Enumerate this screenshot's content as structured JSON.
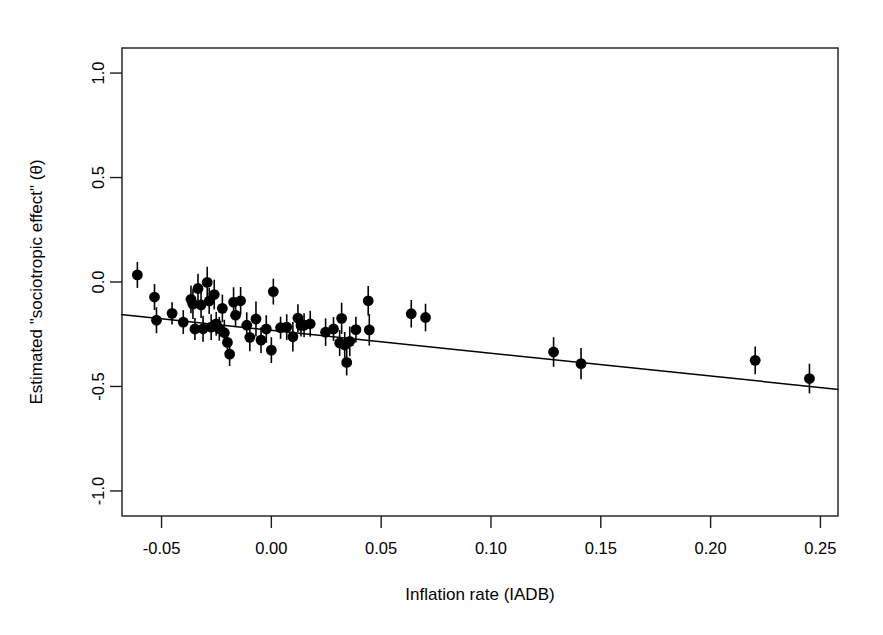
{
  "chart_data": {
    "type": "scatter",
    "title": "",
    "xlabel": "Inflation rate (IADB)",
    "ylabel": "Estimated \"sociotropic effect\" (θ)",
    "xlim": [
      -0.068,
      0.258
    ],
    "ylim": [
      -1.12,
      1.12
    ],
    "xticks": [
      -0.05,
      0.0,
      0.05,
      0.1,
      0.15,
      0.2,
      0.25
    ],
    "xticklabels": [
      "-0.05",
      "0.00",
      "0.05",
      "0.10",
      "0.15",
      "0.20",
      "0.25"
    ],
    "yticks": [
      1.0,
      0.5,
      0.0,
      -0.5,
      -1.0
    ],
    "yticklabels": [
      "1.0",
      "0.5",
      "0.0",
      "-0.5",
      "-1.0"
    ],
    "grid": false,
    "legend": null,
    "marker": "filled-circle",
    "marker_color": "#000000",
    "errorbar_direction": "vertical",
    "errorbar_caps": false,
    "points": [
      {
        "x": -0.061,
        "y": 0.034,
        "yerr": 0.062
      },
      {
        "x": -0.0532,
        "y": -0.072,
        "yerr": 0.062
      },
      {
        "x": -0.0523,
        "y": -0.183,
        "yerr": 0.062
      },
      {
        "x": -0.0452,
        "y": -0.15,
        "yerr": 0.053
      },
      {
        "x": -0.0401,
        "y": -0.192,
        "yerr": 0.057
      },
      {
        "x": -0.0366,
        "y": -0.083,
        "yerr": 0.066
      },
      {
        "x": -0.0357,
        "y": -0.106,
        "yerr": 0.071
      },
      {
        "x": -0.0348,
        "y": -0.225,
        "yerr": 0.053
      },
      {
        "x": -0.0334,
        "y": -0.031,
        "yerr": 0.071
      },
      {
        "x": -0.032,
        "y": -0.11,
        "yerr": 0.062
      },
      {
        "x": -0.0311,
        "y": -0.224,
        "yerr": 0.062
      },
      {
        "x": -0.0292,
        "y": -0.002,
        "yerr": 0.075
      },
      {
        "x": -0.0283,
        "y": -0.091,
        "yerr": 0.062
      },
      {
        "x": -0.0274,
        "y": -0.216,
        "yerr": 0.062
      },
      {
        "x": -0.026,
        "y": -0.06,
        "yerr": 0.071
      },
      {
        "x": -0.0251,
        "y": -0.2,
        "yerr": 0.057
      },
      {
        "x": -0.0237,
        "y": -0.224,
        "yerr": 0.057
      },
      {
        "x": -0.0223,
        "y": -0.126,
        "yerr": 0.066
      },
      {
        "x": -0.0214,
        "y": -0.243,
        "yerr": 0.062
      },
      {
        "x": -0.02,
        "y": -0.289,
        "yerr": 0.062
      },
      {
        "x": -0.019,
        "y": -0.345,
        "yerr": 0.057
      },
      {
        "x": -0.0172,
        "y": -0.096,
        "yerr": 0.071
      },
      {
        "x": -0.0163,
        "y": -0.159,
        "yerr": 0.057
      },
      {
        "x": -0.014,
        "y": -0.09,
        "yerr": 0.066
      },
      {
        "x": -0.0112,
        "y": -0.207,
        "yerr": 0.062
      },
      {
        "x": -0.0098,
        "y": -0.265,
        "yerr": 0.066
      },
      {
        "x": -0.007,
        "y": -0.177,
        "yerr": 0.084
      },
      {
        "x": -0.0047,
        "y": -0.278,
        "yerr": 0.062
      },
      {
        "x": -0.0023,
        "y": -0.225,
        "yerr": 0.066
      },
      {
        "x": 0.0,
        "y": -0.326,
        "yerr": 0.062
      },
      {
        "x": 0.0009,
        "y": -0.046,
        "yerr": 0.062
      },
      {
        "x": 0.0042,
        "y": -0.219,
        "yerr": 0.053
      },
      {
        "x": 0.007,
        "y": -0.216,
        "yerr": 0.062
      },
      {
        "x": 0.0098,
        "y": -0.262,
        "yerr": 0.071
      },
      {
        "x": 0.0121,
        "y": -0.173,
        "yerr": 0.066
      },
      {
        "x": 0.0135,
        "y": -0.208,
        "yerr": 0.053
      },
      {
        "x": 0.0149,
        "y": -0.207,
        "yerr": 0.057
      },
      {
        "x": 0.0177,
        "y": -0.2,
        "yerr": 0.062
      },
      {
        "x": 0.0247,
        "y": -0.24,
        "yerr": 0.066
      },
      {
        "x": 0.0283,
        "y": -0.225,
        "yerr": 0.057
      },
      {
        "x": 0.0311,
        "y": -0.292,
        "yerr": 0.062
      },
      {
        "x": 0.032,
        "y": -0.174,
        "yerr": 0.075
      },
      {
        "x": 0.0334,
        "y": -0.301,
        "yerr": 0.062
      },
      {
        "x": 0.0343,
        "y": -0.385,
        "yerr": 0.062
      },
      {
        "x": 0.0357,
        "y": -0.284,
        "yerr": 0.071
      },
      {
        "x": 0.0385,
        "y": -0.228,
        "yerr": 0.062
      },
      {
        "x": 0.0441,
        "y": -0.09,
        "yerr": 0.071
      },
      {
        "x": 0.0446,
        "y": -0.229,
        "yerr": 0.075
      },
      {
        "x": 0.0637,
        "y": -0.152,
        "yerr": 0.066
      },
      {
        "x": 0.0702,
        "y": -0.17,
        "yerr": 0.066
      },
      {
        "x": 0.1285,
        "y": -0.335,
        "yerr": 0.071
      },
      {
        "x": 0.141,
        "y": -0.391,
        "yerr": 0.075
      },
      {
        "x": 0.2203,
        "y": -0.375,
        "yerr": 0.066
      },
      {
        "x": 0.245,
        "y": -0.462,
        "yerr": 0.071
      }
    ],
    "fit_line": {
      "type": "linear-regression",
      "x_start": -0.0685,
      "y_start": -0.156,
      "x_end": 0.2583,
      "y_end": -0.514,
      "slope": -1.096,
      "intercept": -0.231
    }
  },
  "figure": {
    "background_color": "#ffffff",
    "foreground_color": "#000000"
  }
}
